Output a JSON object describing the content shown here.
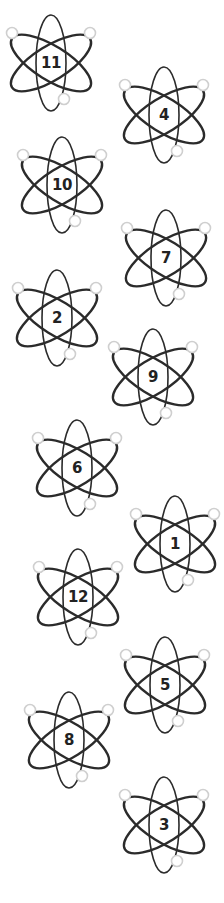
{
  "colors": {
    "stroke": "#2b2b2b",
    "electron": "#cfcfcf",
    "text": "#222222",
    "background": "#ffffff"
  },
  "atoms": [
    {
      "label": "11",
      "cx": 51,
      "cy": 63
    },
    {
      "label": "4",
      "cx": 164,
      "cy": 115
    },
    {
      "label": "10",
      "cx": 62,
      "cy": 185
    },
    {
      "label": "7",
      "cx": 166,
      "cy": 258
    },
    {
      "label": "2",
      "cx": 57,
      "cy": 318
    },
    {
      "label": "9",
      "cx": 153,
      "cy": 377
    },
    {
      "label": "6",
      "cx": 77,
      "cy": 468
    },
    {
      "label": "1",
      "cx": 175,
      "cy": 544
    },
    {
      "label": "12",
      "cx": 78,
      "cy": 597
    },
    {
      "label": "5",
      "cx": 165,
      "cy": 685
    },
    {
      "label": "8",
      "cx": 69,
      "cy": 740
    },
    {
      "label": "3",
      "cx": 164,
      "cy": 825
    }
  ]
}
